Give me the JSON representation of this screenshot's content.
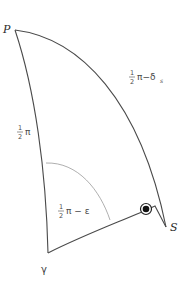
{
  "diagram": {
    "type": "spherical-triangle",
    "vertices": {
      "P": {
        "label": "P",
        "x": 15,
        "y": 30
      },
      "S": {
        "label": "S",
        "x": 166,
        "y": 227
      },
      "Y": {
        "label": "γ",
        "x": 48,
        "y": 253
      }
    },
    "sides": {
      "PS": {
        "label_whole": "π",
        "label_num": "1",
        "label_den": "2",
        "label_rest": "π−δ",
        "label_sub": "s"
      },
      "PY": {
        "label_num": "1",
        "label_den": "2",
        "label_rest": "π"
      }
    },
    "angles": {
      "Y": {
        "label_num": "1",
        "label_den": "2",
        "label_rest": "π − ε"
      }
    },
    "sun_symbol": {
      "name": "sun",
      "x": 146,
      "y": 209
    }
  }
}
